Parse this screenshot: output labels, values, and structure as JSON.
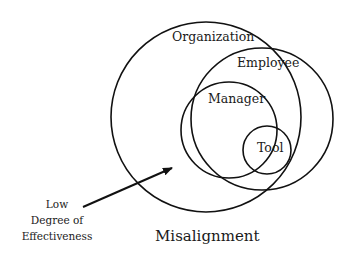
{
  "diagram": {
    "circles": [
      {
        "label": "Organization",
        "cx": 206,
        "cy": 117,
        "r": 95
      },
      {
        "label": "Employee",
        "cx": 262,
        "cy": 119,
        "r": 71
      },
      {
        "label": "Manager",
        "cx": 229,
        "cy": 130,
        "r": 48
      },
      {
        "label": "Tool",
        "cx": 267,
        "cy": 150,
        "r": 24
      }
    ],
    "arrow_label_lines": [
      "Low",
      "Degree of",
      "Effectiveness"
    ],
    "caption": "Misalignment",
    "stroke_color": "#111111"
  }
}
